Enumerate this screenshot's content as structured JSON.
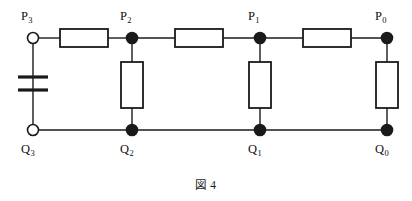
{
  "figure": {
    "caption": "図 4",
    "caption_x": 0,
    "caption_y": 176,
    "type": "ladder-network-circuit",
    "background_color": "#ffffff",
    "line_color": "#1a1a1a",
    "fill_color": "#ffffff"
  },
  "geometry": {
    "top_rail_y": 38,
    "bottom_rail_y": 130,
    "left_x": 33,
    "right_x": 387,
    "node_xs": [
      33,
      132,
      260,
      387
    ]
  },
  "terminals": {
    "open_circle_radius": 5.5,
    "filled_dot_radius": 5.5
  },
  "top_nodes": [
    {
      "id": "P3",
      "label": "P",
      "sub": "3",
      "x": 33,
      "y": 38,
      "marker": "open-circle",
      "label_x": 21,
      "label_y": 10
    },
    {
      "id": "P2",
      "label": "P",
      "sub": "2",
      "x": 132,
      "y": 38,
      "marker": "filled-dot",
      "label_x": 120,
      "label_y": 10
    },
    {
      "id": "P1",
      "label": "P",
      "sub": "1",
      "x": 260,
      "y": 38,
      "marker": "filled-dot",
      "label_x": 248,
      "label_y": 10
    },
    {
      "id": "P0",
      "label": "P",
      "sub": "0",
      "x": 387,
      "y": 38,
      "marker": "filled-dot",
      "label_x": 375,
      "label_y": 10
    }
  ],
  "bottom_nodes": [
    {
      "id": "Q3",
      "label": "Q",
      "sub": "3",
      "x": 33,
      "y": 130,
      "marker": "open-circle",
      "label_x": 21,
      "label_y": 143
    },
    {
      "id": "Q2",
      "label": "Q",
      "sub": "2",
      "x": 132,
      "y": 130,
      "marker": "filled-dot",
      "label_x": 120,
      "label_y": 143
    },
    {
      "id": "Q1",
      "label": "Q",
      "sub": "1",
      "x": 260,
      "y": 130,
      "marker": "filled-dot",
      "label_x": 248,
      "label_y": 143
    },
    {
      "id": "Q0",
      "label": "Q",
      "sub": "0",
      "x": 387,
      "y": 130,
      "marker": "filled-dot",
      "label_x": 375,
      "label_y": 143
    }
  ],
  "series_resistors": [
    {
      "id": "Rs3",
      "x": 60,
      "y": 29,
      "w": 48,
      "h": 18,
      "orientation": "horizontal"
    },
    {
      "id": "Rs2",
      "x": 175,
      "y": 29,
      "w": 48,
      "h": 18,
      "orientation": "horizontal"
    },
    {
      "id": "Rs1",
      "x": 303,
      "y": 29,
      "w": 48,
      "h": 18,
      "orientation": "horizontal"
    }
  ],
  "shunt_resistors": [
    {
      "id": "Rp2",
      "x": 121,
      "y": 62,
      "w": 22,
      "h": 46,
      "orientation": "vertical"
    },
    {
      "id": "Rp1",
      "x": 249,
      "y": 62,
      "w": 22,
      "h": 46,
      "orientation": "vertical"
    },
    {
      "id": "Rp0",
      "x": 376,
      "y": 62,
      "w": 22,
      "h": 46,
      "orientation": "vertical"
    }
  ],
  "source": {
    "id": "battery",
    "type": "battery-cell",
    "x": 33,
    "long_plate_y": 77,
    "long_plate_half_width": 15,
    "short_plate_y": 90,
    "short_plate_half_width": 15,
    "top_lead_from": 44,
    "bottom_lead_to": 124
  },
  "wires": {
    "top_segments": [
      {
        "from_x": 33,
        "to_x": 60,
        "y": 38
      },
      {
        "from_x": 108,
        "to_x": 132,
        "y": 38
      },
      {
        "from_x": 132,
        "to_x": 175,
        "y": 38
      },
      {
        "from_x": 223,
        "to_x": 260,
        "y": 38
      },
      {
        "from_x": 260,
        "to_x": 303,
        "y": 38
      },
      {
        "from_x": 351,
        "to_x": 387,
        "y": 38
      }
    ],
    "bottom_segments": [
      {
        "from_x": 33,
        "to_x": 387,
        "y": 130
      }
    ],
    "vertical_stubs": [
      {
        "x": 132,
        "from_y": 38,
        "to_y": 62
      },
      {
        "x": 132,
        "from_y": 108,
        "to_y": 130
      },
      {
        "x": 260,
        "from_y": 38,
        "to_y": 62
      },
      {
        "x": 260,
        "from_y": 108,
        "to_y": 130
      },
      {
        "x": 387,
        "from_y": 38,
        "to_y": 62
      },
      {
        "x": 387,
        "from_y": 108,
        "to_y": 130
      }
    ]
  }
}
